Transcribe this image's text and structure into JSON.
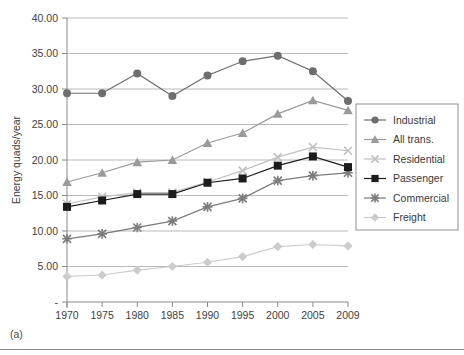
{
  "caption": "(a)",
  "chart_data": {
    "type": "line",
    "title": "",
    "xlabel": "",
    "ylabel": "Energy quads/year",
    "x": [
      1970,
      1975,
      1980,
      1985,
      1990,
      1995,
      2000,
      2005,
      2009
    ],
    "categories": [
      "1970",
      "1975",
      "1980",
      "1985",
      "1990",
      "1995",
      "2000",
      "2005",
      "2009"
    ],
    "ylim": [
      0,
      40
    ],
    "yticks": [
      0,
      5,
      10,
      15,
      20,
      25,
      30,
      35,
      40
    ],
    "ytick_labels": [
      "-",
      "5.00",
      "10.00",
      "15.00",
      "20.00",
      "25.00",
      "30.00",
      "35.00",
      "40.00"
    ],
    "grid": true,
    "legend_position": "right",
    "series": [
      {
        "name": "Industrial",
        "marker": "circle",
        "color": "#6e6e6e",
        "values": [
          29.4,
          29.4,
          32.2,
          29.0,
          31.9,
          33.9,
          34.7,
          32.5,
          28.3
        ]
      },
      {
        "name": "All trans.",
        "marker": "triangle",
        "color": "#9a9a9a",
        "values": [
          16.9,
          18.2,
          19.7,
          20.0,
          22.4,
          23.8,
          26.5,
          28.4,
          27.0
        ]
      },
      {
        "name": "Residential",
        "marker": "x-light",
        "color": "#c2c2c2",
        "values": [
          13.8,
          14.8,
          15.4,
          15.4,
          16.9,
          18.5,
          20.4,
          21.8,
          21.3
        ]
      },
      {
        "name": "Passenger",
        "marker": "square",
        "color": "#1c1c1c",
        "values": [
          13.4,
          14.3,
          15.2,
          15.2,
          16.8,
          17.4,
          19.2,
          20.5,
          19.0
        ]
      },
      {
        "name": "Commercial",
        "marker": "asterisk",
        "color": "#7c7c7c",
        "values": [
          8.9,
          9.6,
          10.5,
          11.4,
          13.4,
          14.6,
          17.1,
          17.8,
          18.2
        ]
      },
      {
        "name": "Freight",
        "marker": "diamond",
        "color": "#cccccc",
        "values": [
          3.6,
          3.8,
          4.5,
          5.0,
          5.6,
          6.4,
          7.8,
          8.1,
          7.9
        ]
      }
    ]
  }
}
